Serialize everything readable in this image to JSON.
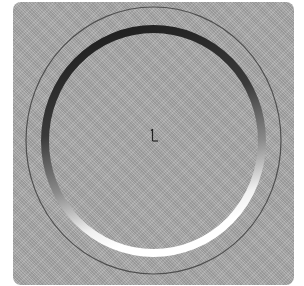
{
  "figure": {
    "colors": {
      "plate": "#a9a9a9",
      "outer_circle": "#4a4a4a",
      "ring_top": "#1e1e1e",
      "ring_bottom": "#f4f4f4",
      "axis_marker": "#222222"
    },
    "shapes": {
      "plate": {
        "x": 13,
        "y": 2,
        "width": 281,
        "height": 283
      },
      "outer_circle": {
        "cx": 153.5,
        "cy": 140.5,
        "rx": 127.5,
        "ry": 133.5
      },
      "thick_ring": {
        "cx": 153.5,
        "cy": 141,
        "rx": 108.5,
        "ry": 112,
        "stroke_width": 8
      },
      "axis_marker": {
        "x": 153,
        "y": 135
      }
    },
    "center_marker_label": "L"
  }
}
